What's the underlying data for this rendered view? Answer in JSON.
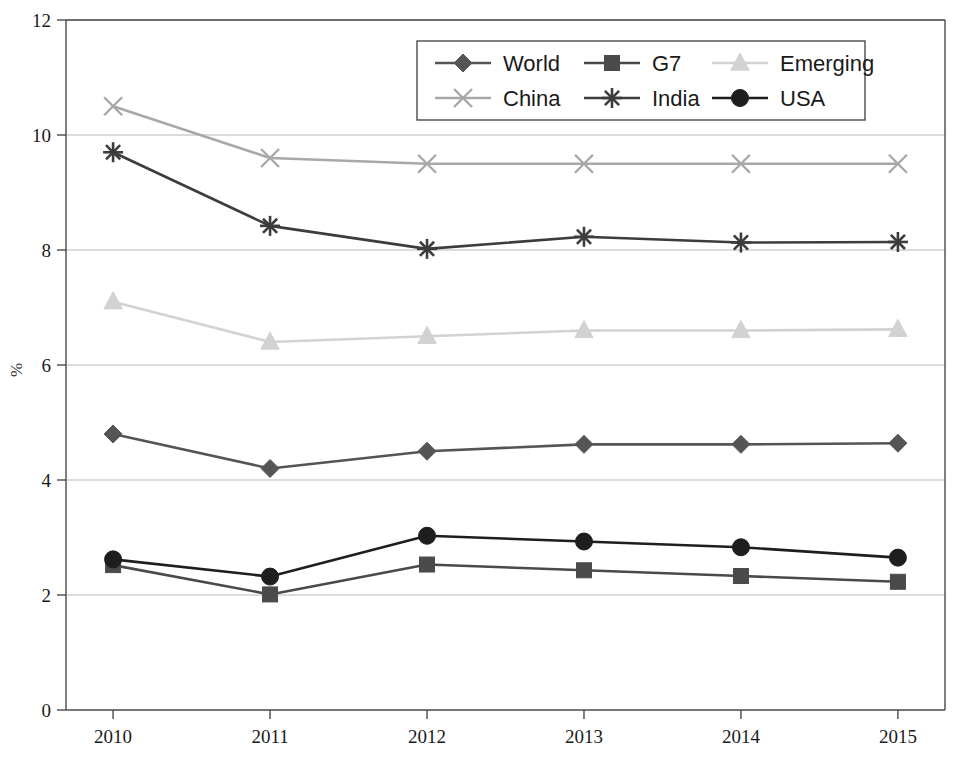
{
  "chart_data": {
    "type": "line",
    "title": "",
    "subtitle": "",
    "xlabel": "",
    "ylabel": "%",
    "x": [
      2010,
      2011,
      2012,
      2013,
      2014,
      2015
    ],
    "categories": [
      "2010",
      "2011",
      "2012",
      "2013",
      "2014",
      "2015"
    ],
    "xlim": [
      2009.7,
      2015.3
    ],
    "ylim": [
      0,
      12
    ],
    "yticks": [
      0,
      2,
      4,
      6,
      8,
      10,
      12
    ],
    "ytick_labels": [
      "0",
      "2",
      "4",
      "6",
      "8",
      "10",
      "12"
    ],
    "xtick_labels": [
      "2010",
      "2011",
      "2012",
      "2013",
      "2014",
      "2015"
    ],
    "grid": "horizontal",
    "legend_position": "top-center",
    "legend_columns": 3,
    "legend_rows": 2,
    "series": [
      {
        "name": "World",
        "marker": "diamond",
        "color": "#555555",
        "values": [
          4.8,
          4.2,
          4.5,
          4.62,
          4.62,
          4.64
        ]
      },
      {
        "name": "G7",
        "marker": "square",
        "color": "#4a4a4a",
        "values": [
          2.52,
          2.01,
          2.53,
          2.43,
          2.33,
          2.23
        ]
      },
      {
        "name": "Emerging",
        "marker": "triangle",
        "color": "#d2d2d2",
        "values": [
          7.1,
          6.4,
          6.5,
          6.6,
          6.6,
          6.62
        ]
      },
      {
        "name": "China",
        "marker": "x",
        "color": "#a8a8a8",
        "values": [
          10.5,
          9.6,
          9.5,
          9.5,
          9.5,
          9.5
        ]
      },
      {
        "name": "India",
        "marker": "star",
        "color": "#3c3c3c",
        "values": [
          9.7,
          8.42,
          8.02,
          8.23,
          8.13,
          8.14
        ]
      },
      {
        "name": "USA",
        "marker": "circle",
        "color": "#1e1e1e",
        "values": [
          2.62,
          2.32,
          3.03,
          2.93,
          2.83,
          2.65
        ]
      }
    ]
  },
  "legend": {
    "entries": [
      {
        "label": "World"
      },
      {
        "label": "G7"
      },
      {
        "label": "Emerging"
      },
      {
        "label": "China"
      },
      {
        "label": "India"
      },
      {
        "label": "USA"
      }
    ]
  },
  "axes": {
    "y_title": "%"
  }
}
